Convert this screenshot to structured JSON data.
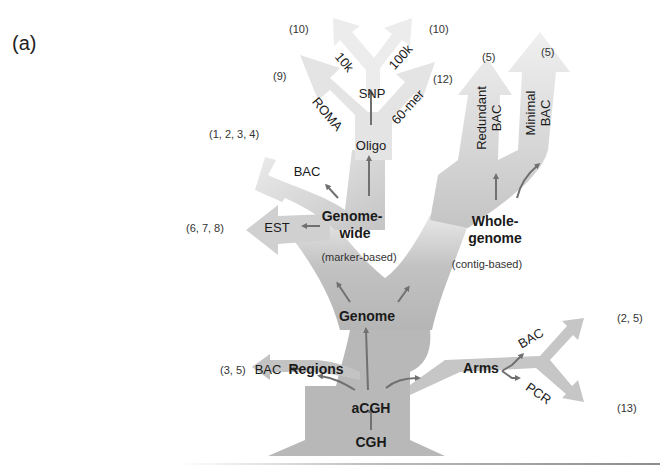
{
  "panel_label": "(a)",
  "colors": {
    "trunk": "#b9b9b9",
    "branch_light": "#e6e6e6",
    "branch_mid": "#d2d2d2",
    "arrow": "#707070",
    "text": "#1a1a1a"
  },
  "nodes": {
    "cgh": "CGH",
    "acgh": "aCGH",
    "genome": "Genome",
    "regions": "Regions",
    "arms": "Arms",
    "genome_wide_line1": "Genome-",
    "genome_wide_line2": "wide",
    "genome_wide_note": "(marker-based)",
    "whole_genome_line1": "Whole-",
    "whole_genome_line2": "genome",
    "whole_genome_note": "(contig-based)",
    "oligo": "Oligo",
    "snp": "SNP"
  },
  "leaves": {
    "regions_bac": "BAC",
    "arms_bac": "BAC",
    "arms_pcr": "PCR",
    "genome_wide_est": "EST",
    "genome_wide_bac": "BAC",
    "oligo_roma": "ROMA",
    "oligo_60mer": "60-mer",
    "snp_10k": "10k",
    "snp_100k": "100k",
    "redundant_bac_line1": "Redundant",
    "redundant_bac_line2": "BAC",
    "minimal_bac_line1": "Minimal",
    "minimal_bac_line2": "BAC"
  },
  "refs": {
    "regions_bac": "(3, 5)",
    "arms_bac": "(2, 5)",
    "arms_pcr": "(13)",
    "est": "(6, 7, 8)",
    "genome_wide_bac": "(1, 2, 3, 4)",
    "roma": "(9)",
    "snp_10k": "(10)",
    "snp_100k": "(10)",
    "sixty_mer": "(12)",
    "redundant_bac": "(5)",
    "minimal_bac": "(5)"
  }
}
